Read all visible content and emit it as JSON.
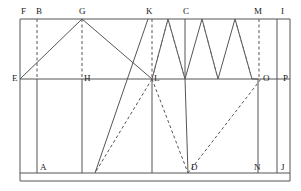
{
  "figure": {
    "stroke_color": "#555555",
    "label_color": "#1a1a1a",
    "background": "#ffffff",
    "width": 301,
    "height": 191
  },
  "labels": [
    {
      "text": "F",
      "x": 21,
      "y": 7,
      "name": "point-label-f"
    },
    {
      "text": "B",
      "x": 36,
      "y": 7,
      "name": "point-label-b"
    },
    {
      "text": "G",
      "x": 79,
      "y": 7,
      "name": "point-label-g"
    },
    {
      "text": "K",
      "x": 146,
      "y": 7,
      "name": "point-label-k"
    },
    {
      "text": "C",
      "x": 183,
      "y": 7,
      "name": "point-label-c"
    },
    {
      "text": "M",
      "x": 254,
      "y": 7,
      "name": "point-label-m"
    },
    {
      "text": "I",
      "x": 281,
      "y": 7,
      "name": "point-label-i"
    },
    {
      "text": "E",
      "x": 12,
      "y": 74,
      "name": "point-label-e"
    },
    {
      "text": "H",
      "x": 84,
      "y": 74,
      "name": "point-label-h"
    },
    {
      "text": "L",
      "x": 154,
      "y": 74,
      "name": "point-label-l"
    },
    {
      "text": "O",
      "x": 263,
      "y": 74,
      "name": "point-label-o"
    },
    {
      "text": "P",
      "x": 283,
      "y": 74,
      "name": "point-label-p"
    },
    {
      "text": "A",
      "x": 40,
      "y": 163,
      "name": "point-label-a"
    },
    {
      "text": "D",
      "x": 191,
      "y": 163,
      "name": "point-label-d"
    },
    {
      "text": "N",
      "x": 254,
      "y": 163,
      "name": "point-label-n"
    },
    {
      "text": "J",
      "x": 281,
      "y": 163,
      "name": "point-label-j"
    }
  ],
  "geometry": {
    "top_y": 19,
    "mid_y": 79,
    "bottom_y": 173,
    "outer_bottom_y": 181,
    "left_x": 20,
    "right_x": 277,
    "outer_right_x": 290,
    "verticals": [
      37,
      82,
      152,
      185,
      258
    ],
    "zigzag_points": "20,79 82,19 152,79 168,19 185,79 202,19 218,79 235,19 252,79",
    "solid_diagonal": "95,173 148,19",
    "dashed_l_to_d": "152,79 188,173",
    "dashed_d_to_o": "188,173 261,79",
    "dashed_verticals": [
      37,
      82,
      152,
      259
    ]
  }
}
